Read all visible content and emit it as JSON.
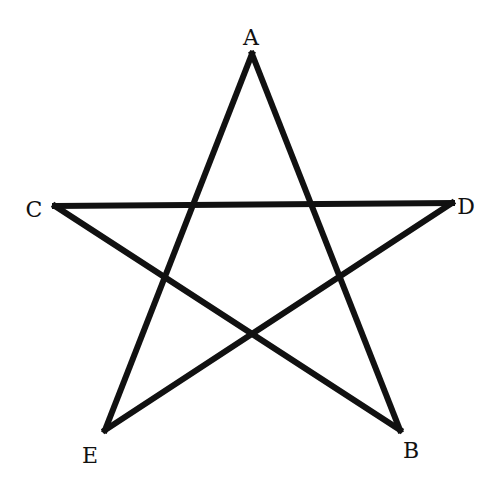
{
  "diagram": {
    "title": "",
    "type": "pentagram",
    "stroke_color": "#111111",
    "stroke_width": 6,
    "vertices": [
      {
        "id": "A",
        "label": "A",
        "x": 252,
        "y": 54,
        "label_x": 251,
        "label_y": 38
      },
      {
        "id": "B",
        "label": "B",
        "x": 400,
        "y": 430,
        "label_x": 411,
        "label_y": 451
      },
      {
        "id": "C",
        "label": "C",
        "x": 55,
        "y": 206,
        "label_x": 34,
        "label_y": 210
      },
      {
        "id": "D",
        "label": "D",
        "x": 452,
        "y": 203,
        "label_x": 466,
        "label_y": 207
      },
      {
        "id": "E",
        "label": "E",
        "x": 105,
        "y": 430,
        "label_x": 90,
        "label_y": 456
      }
    ],
    "edges": [
      [
        "A",
        "B"
      ],
      [
        "B",
        "C"
      ],
      [
        "C",
        "D"
      ],
      [
        "D",
        "E"
      ],
      [
        "E",
        "A"
      ]
    ]
  }
}
